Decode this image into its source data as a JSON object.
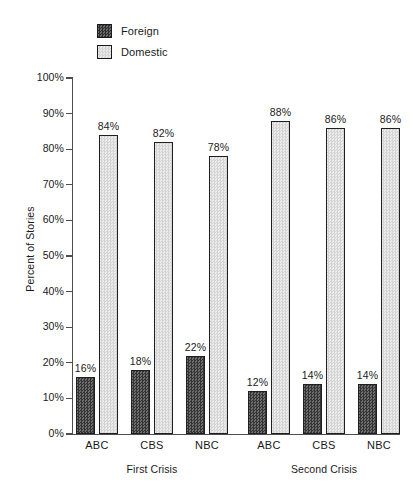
{
  "chart_data": {
    "type": "bar",
    "title": "",
    "xlabel": "",
    "ylabel": "Percent of Stories",
    "ylim": [
      0,
      100
    ],
    "ytick_labels": [
      "100%",
      "90%",
      "80%",
      "70%",
      "60%",
      "50%",
      "40%",
      "30%",
      "20%",
      "10%",
      "0%"
    ],
    "ytick_values": [
      100,
      90,
      80,
      70,
      60,
      50,
      40,
      30,
      20,
      10,
      0
    ],
    "grid": false,
    "legend_position": "top-left",
    "categories": [
      "ABC",
      "CBS",
      "NBC",
      "ABC",
      "CBS",
      "NBC"
    ],
    "groups": [
      {
        "label": "First Crisis",
        "categories": [
          "ABC",
          "CBS",
          "NBC"
        ]
      },
      {
        "label": "Second Crisis",
        "categories": [
          "ABC",
          "CBS",
          "NBC"
        ]
      }
    ],
    "series": [
      {
        "name": "Foreign",
        "color": "#4f4f4f",
        "pattern": "checkered-dark",
        "values": [
          16,
          18,
          22,
          12,
          14,
          14
        ],
        "labels": [
          "16%",
          "18%",
          "22%",
          "12%",
          "14%",
          "14%"
        ]
      },
      {
        "name": "Domestic",
        "color": "#dedede",
        "pattern": "stipple-light",
        "values": [
          84,
          82,
          78,
          88,
          86,
          86
        ],
        "labels": [
          "84%",
          "82%",
          "78%",
          "88%",
          "86%",
          "86%"
        ]
      }
    ]
  },
  "legend": {
    "items": [
      {
        "label": "Foreign",
        "swatch": "foreign-swatch"
      },
      {
        "label": "Domestic",
        "swatch": "domestic-swatch"
      }
    ]
  },
  "axis": {
    "y_title": "Percent of Stories"
  }
}
